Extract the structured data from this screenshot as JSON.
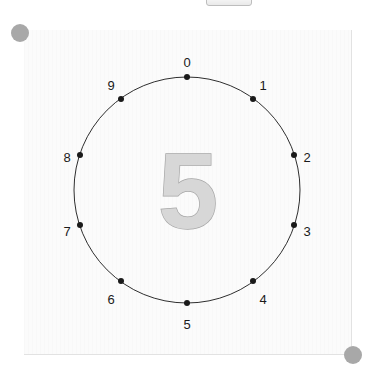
{
  "widget": {
    "name": "circular-number-dial",
    "center_value": "5",
    "paper_color": "#fbfbfb",
    "ring_color": "#2e2e2e",
    "dot_color": "#1a1a1a",
    "label_color": "#1a1a1a",
    "glyph_fill": "#d7d7d7",
    "glyph_stroke": "#a6a6a6",
    "handle_color": "#a8a8a8"
  },
  "top_chip": {
    "label": ""
  },
  "handles": [
    {
      "name": "resize-handle-top-left",
      "x": 20,
      "y": 33
    },
    {
      "name": "resize-handle-bottom-right",
      "x": 353,
      "y": 355
    }
  ],
  "dial": {
    "center_x": 187,
    "center_y": 190,
    "radius": 113,
    "label_radius": 131,
    "tick_count": 10,
    "ticks": [
      {
        "label": "0",
        "angle_deg": 0,
        "dot_x": 187,
        "dot_y": 77,
        "label_x": 187,
        "label_y": 64,
        "anchor": "middle"
      },
      {
        "label": "1",
        "angle_deg": 36,
        "dot_x": 253,
        "dot_y": 99,
        "label_x": 263,
        "label_y": 87,
        "anchor": "middle"
      },
      {
        "label": "2",
        "angle_deg": 72,
        "dot_x": 294,
        "dot_y": 155,
        "label_x": 307,
        "label_y": 159,
        "anchor": "middle"
      },
      {
        "label": "3",
        "angle_deg": 108,
        "dot_x": 294,
        "dot_y": 225,
        "label_x": 307,
        "label_y": 233,
        "anchor": "middle"
      },
      {
        "label": "4",
        "angle_deg": 144,
        "dot_x": 253,
        "dot_y": 281,
        "label_x": 263,
        "label_y": 301,
        "anchor": "middle"
      },
      {
        "label": "5",
        "angle_deg": 180,
        "dot_x": 187,
        "dot_y": 303,
        "label_x": 187,
        "label_y": 326,
        "anchor": "middle"
      },
      {
        "label": "6",
        "angle_deg": 216,
        "dot_x": 121,
        "dot_y": 281,
        "label_x": 111,
        "label_y": 301,
        "anchor": "middle"
      },
      {
        "label": "7",
        "angle_deg": 252,
        "dot_x": 80,
        "dot_y": 225,
        "label_x": 67,
        "label_y": 233,
        "anchor": "middle"
      },
      {
        "label": "8",
        "angle_deg": 288,
        "dot_x": 80,
        "dot_y": 155,
        "label_x": 67,
        "label_y": 159,
        "anchor": "middle"
      },
      {
        "label": "9",
        "angle_deg": 324,
        "dot_x": 121,
        "dot_y": 99,
        "label_x": 111,
        "label_y": 87,
        "anchor": "middle"
      }
    ]
  }
}
